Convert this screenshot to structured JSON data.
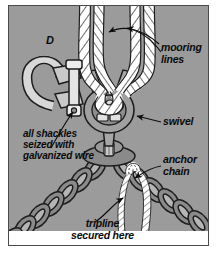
{
  "figure": {
    "type": "technical-illustration",
    "panel_letter": "D",
    "background_color": "#9b9b9b",
    "border_color": "#4a4a4a",
    "ink_color": "#0a0a0a",
    "rope_color": "#ffffff",
    "metal_color": "#8e8e8e"
  },
  "labels": {
    "mooring_lines": "mooring\nlines",
    "swivel": "swivel",
    "anchor_chain": "anchor\nchain",
    "shackles_note": "all shackles\nseized with\ngalvanized wire",
    "tripline": "tripline\nsecured here",
    "panel_letter": "D"
  },
  "parts": {
    "rope_left": "mooring-line-rope-left",
    "rope_right": "mooring-line-rope-right",
    "swivel": "swivel-fitting",
    "shackle_detail": "anchor-shackle-detail",
    "chain_left": "anchor-chain-left-leg",
    "chain_right": "anchor-chain-right-leg",
    "tripline_rope": "tripline-rope",
    "center_link": "center-connecting-plate"
  }
}
